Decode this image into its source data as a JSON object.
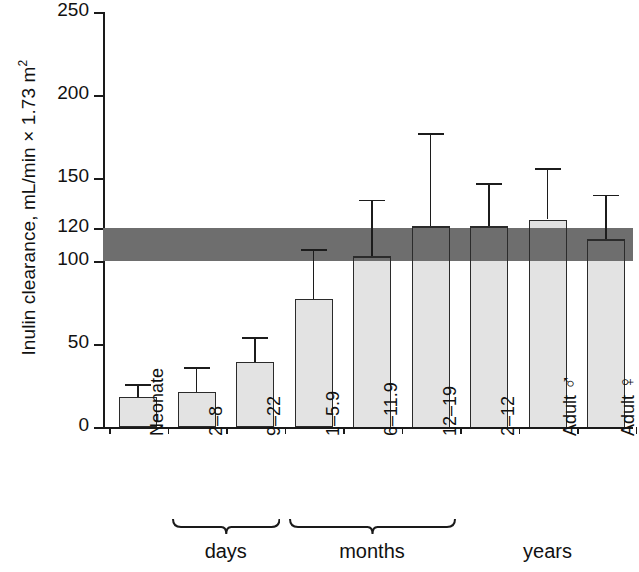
{
  "chart_data": {
    "type": "bar",
    "title": "",
    "xlabel": "",
    "ylabel": "Inulin clearance, mL/min × 1.73 m",
    "ylabel_exponent": "2",
    "ylim": [
      0,
      250
    ],
    "yticks": [
      0,
      50,
      100,
      120,
      150,
      200,
      250
    ],
    "ytick_labels": [
      "0",
      "50",
      "100",
      "120",
      "150",
      "200",
      "250"
    ],
    "grid": false,
    "legend": "none",
    "categories": [
      "Neonate",
      "2–8",
      "9–22",
      "1–5.9",
      "6–11.9",
      "12–19",
      "2–12",
      "Adult ♂",
      "Adult ♀"
    ],
    "category_labels": [
      {
        "text": "Neonate",
        "symbol": ""
      },
      {
        "text": "2–8",
        "symbol": ""
      },
      {
        "text": "9–22",
        "symbol": ""
      },
      {
        "text": "1–5.9",
        "symbol": ""
      },
      {
        "text": "6–11.9",
        "symbol": ""
      },
      {
        "text": "12–19",
        "symbol": ""
      },
      {
        "text": "2–12",
        "symbol": ""
      },
      {
        "text": "Adult ",
        "symbol": "♂"
      },
      {
        "text": "Adult ",
        "symbol": "♀"
      }
    ],
    "values": [
      18,
      21,
      39,
      77,
      103,
      121,
      121,
      125,
      113
    ],
    "errors_upper": [
      26,
      36,
      54,
      107,
      137,
      177,
      147,
      156,
      140
    ],
    "reference_band": {
      "label": "",
      "low": 100,
      "high": 120,
      "color": "#6e6e6e"
    },
    "bar_fill_color": "#e3e3e3",
    "bar_edge_color": "#2b2b2b",
    "groups": [
      {
        "label": "days",
        "first": 1,
        "last": 2,
        "brace": true
      },
      {
        "label": "months",
        "first": 3,
        "last": 5,
        "brace": true
      },
      {
        "label": "years",
        "first": 6,
        "last": 8,
        "brace": false
      }
    ]
  }
}
